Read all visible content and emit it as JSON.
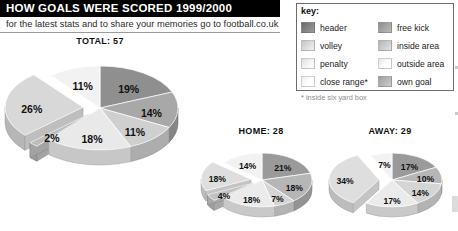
{
  "header": {
    "title": "HOW GOALS WERE SCORED 1999/2000",
    "subtitle": "for the latest stats and to share your memories go to football.co.uk"
  },
  "legend": {
    "title": "key:",
    "note": "* inside six yard box",
    "items": [
      {
        "label": "header",
        "color": "#6b6b6b",
        "column": "left"
      },
      {
        "label": "volley",
        "color": "#c4c4c4",
        "column": "left"
      },
      {
        "label": "penalty",
        "color": "#dcdcdc",
        "column": "left"
      },
      {
        "label": "close range*",
        "color": "#efefef",
        "column": "left"
      },
      {
        "label": "free kick",
        "color": "#8d8d8d",
        "column": "right"
      },
      {
        "label": "inside area",
        "color": "#b4b4b4",
        "column": "right"
      },
      {
        "label": "outside area",
        "color": "#e6e6e6",
        "column": "right"
      },
      {
        "label": "own goal",
        "color": "#9e9e9e",
        "column": "right"
      }
    ]
  },
  "chart_data": [
    {
      "type": "pie",
      "name": "total",
      "title": "TOTAL: 57",
      "categories": [
        "header",
        "free kick",
        "inside area",
        "outside area",
        "own goal",
        "close range",
        "volley"
      ],
      "values": [
        19,
        14,
        11,
        18,
        2,
        26,
        11
      ],
      "labels": [
        "19%",
        "14%",
        "11%",
        "18%",
        "2%",
        "26%",
        "11%"
      ],
      "colors": [
        "#8f8f8f",
        "#a8a8a8",
        "#cfcfcf",
        "#e9e9e9",
        "#bdbdbd",
        "#d8d8d8",
        "#f2f2f2"
      ],
      "exploded": [
        false,
        false,
        false,
        false,
        true,
        true,
        false
      ],
      "legend": "external"
    },
    {
      "type": "pie",
      "name": "home",
      "title": "HOME: 28",
      "categories": [
        "header",
        "free kick",
        "inside area",
        "outside area",
        "own goal",
        "close range",
        "volley"
      ],
      "values": [
        21,
        18,
        7,
        18,
        4,
        18,
        14
      ],
      "labels": [
        "21%",
        "18%",
        "7%",
        "18%",
        "4%",
        "18%",
        "14%"
      ],
      "colors": [
        "#9a9a9a",
        "#b6b6b6",
        "#d5d5d5",
        "#ebebeb",
        "#c2c2c2",
        "#dedede",
        "#f2f2f2"
      ],
      "exploded": [
        false,
        false,
        false,
        false,
        true,
        true,
        false
      ],
      "legend": "external"
    },
    {
      "type": "pie",
      "name": "away",
      "title": "AWAY: 29",
      "categories": [
        "header",
        "free kick",
        "inside area",
        "outside area",
        "close range",
        "volley"
      ],
      "values": [
        17,
        10,
        14,
        17,
        34,
        7
      ],
      "labels": [
        "17%",
        "10%",
        "14%",
        "17%",
        "34%",
        "7%"
      ],
      "colors": [
        "#9a9a9a",
        "#b6b6b6",
        "#d5d5d5",
        "#ebebeb",
        "#dedede",
        "#f2f2f2"
      ],
      "exploded": [
        false,
        false,
        false,
        false,
        true,
        false
      ],
      "legend": "external"
    }
  ]
}
